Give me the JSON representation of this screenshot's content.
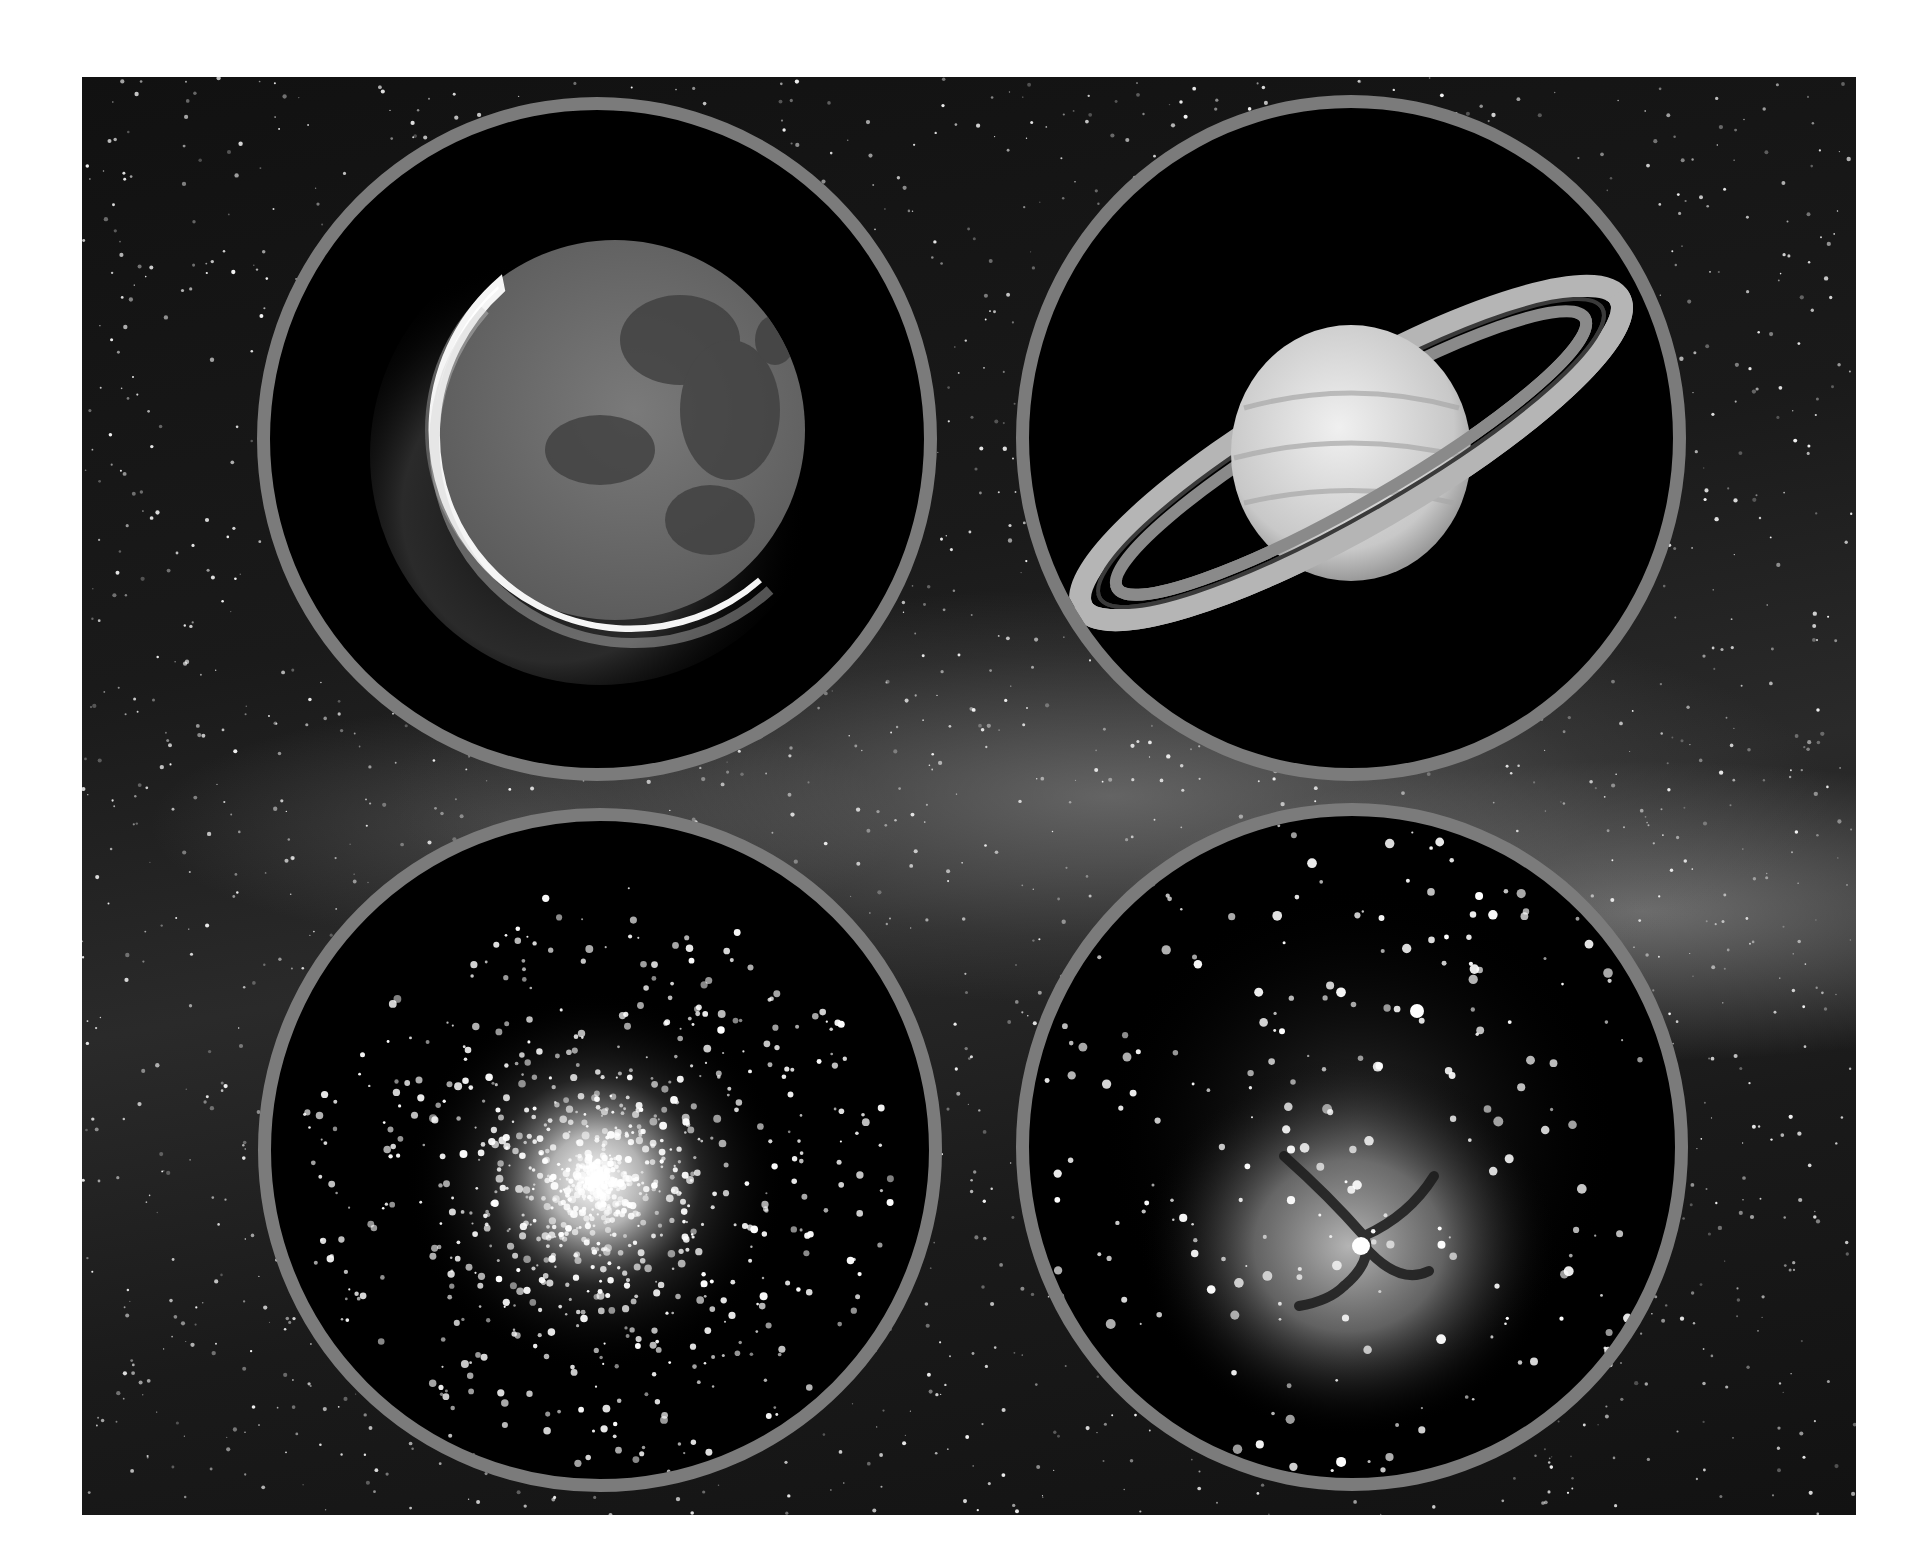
{
  "image": {
    "kind": "astronomy montage",
    "background": {
      "subject": "Milky Way star field",
      "description": "Dense star field with a bright diagonal band of the Milky Way crossing the middle of the frame"
    },
    "border_color": "#7b7b7b",
    "page_color": "#ffffff",
    "insets": [
      {
        "id": "top-left",
        "subject": "Crescent Moon",
        "description": "Thin bright crescent on lower-left limb with earthshine illuminating the rest of the lunar disc"
      },
      {
        "id": "top-right",
        "subject": "Saturn",
        "description": "Saturn with banded globe and tilted ring system"
      },
      {
        "id": "bottom-left",
        "subject": "Globular star cluster",
        "description": "Dense spherical concentration of stars bright at the core"
      },
      {
        "id": "bottom-right",
        "subject": "Trifid Nebula",
        "description": "Emission nebula divided by dark dust lanes surrounded by stars"
      }
    ]
  }
}
